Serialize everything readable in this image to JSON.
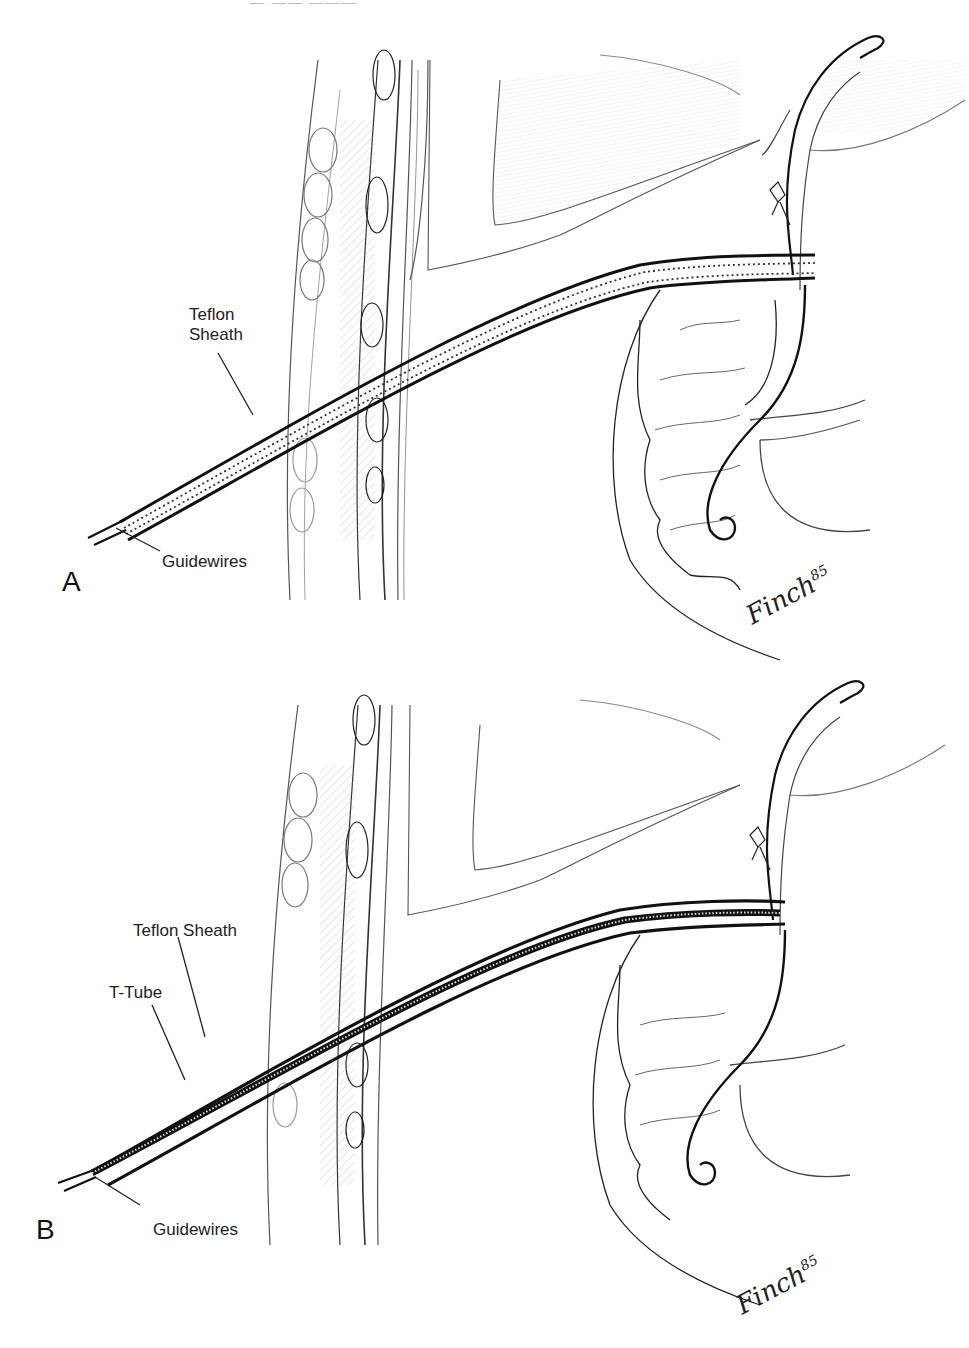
{
  "figure": {
    "header_fragment": "— —— ———",
    "panels": [
      {
        "id": "A",
        "letter": "A",
        "labels": {
          "sheath": [
            "Teflon",
            "Sheath"
          ],
          "guidewires": "Guidewires"
        },
        "signature": {
          "name": "Finch",
          "year": "85"
        }
      },
      {
        "id": "B",
        "letter": "B",
        "labels": {
          "sheath": "Teflon Sheath",
          "t_tube": "T-Tube",
          "guidewires": "Guidewires"
        },
        "signature": {
          "name": "Finch",
          "year": "85"
        }
      }
    ],
    "colors": {
      "ink": "#1a1a1a",
      "light_ink": "#777777",
      "shading": "#c8c8c8",
      "background": "#ffffff"
    }
  }
}
